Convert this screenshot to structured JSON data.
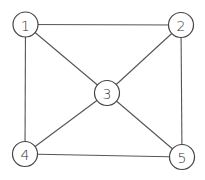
{
  "diagram": {
    "type": "undirected-graph",
    "width": 205,
    "height": 180,
    "node_radius": 12.5,
    "colors": {
      "background": "#ffffff",
      "edge": "#555555",
      "node_stroke": "#444444",
      "node_fill": "#ffffff",
      "label": "#333333"
    },
    "nodes": [
      {
        "id": "1",
        "label": "1",
        "x": 25.5,
        "y": 24.5
      },
      {
        "id": "2",
        "label": "2",
        "x": 181,
        "y": 25
      },
      {
        "id": "3",
        "label": "3",
        "x": 107,
        "y": 93
      },
      {
        "id": "4",
        "label": "4",
        "x": 25,
        "y": 154
      },
      {
        "id": "5",
        "label": "5",
        "x": 182,
        "y": 157
      }
    ],
    "edges": [
      {
        "from": "1",
        "to": "2"
      },
      {
        "from": "1",
        "to": "3"
      },
      {
        "from": "1",
        "to": "4"
      },
      {
        "from": "2",
        "to": "3"
      },
      {
        "from": "2",
        "to": "5"
      },
      {
        "from": "3",
        "to": "4"
      },
      {
        "from": "3",
        "to": "5"
      },
      {
        "from": "4",
        "to": "5"
      }
    ]
  }
}
